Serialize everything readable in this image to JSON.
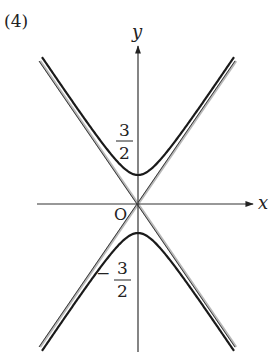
{
  "figure": {
    "panel_label": "(4)",
    "x_axis_label": "x",
    "y_axis_label": "y",
    "origin_label": "O",
    "upper_vertex_label": {
      "numerator": "3",
      "denominator": "2",
      "sign": ""
    },
    "lower_vertex_label": {
      "numerator": "3",
      "denominator": "2",
      "sign": "−"
    },
    "curve_color": "#1a1a1a",
    "asymptote_color": "#9a9a9a",
    "axis_color": "#333333"
  },
  "chart_data": {
    "type": "diagram",
    "title": "(4)",
    "xlabel": "x",
    "ylabel": "y",
    "vertices": [
      [
        0,
        1.5
      ],
      [
        0,
        -1.5
      ]
    ],
    "asymptote_slopes": [
      1.5,
      -1.5
    ],
    "origin": "O"
  }
}
